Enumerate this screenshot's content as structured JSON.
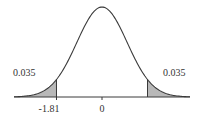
{
  "chart_data": {
    "type": "area",
    "title": "",
    "xlabel": "",
    "ylabel": "",
    "distribution": "bell curve",
    "mean": 0,
    "tick_labels": [
      "-1.81",
      "0"
    ],
    "shaded_regions": [
      {
        "side": "left",
        "bound": -1.81,
        "area_label": "0.035"
      },
      {
        "side": "right",
        "bound": 1.81,
        "area_label": "0.035"
      }
    ],
    "annotations": [
      "0.035",
      "0.035"
    ],
    "xlim": [
      -3.5,
      3.5
    ],
    "grid": false,
    "legend": "none"
  },
  "labels": {
    "left_area": "0.035",
    "right_area": "0.035",
    "left_bound": "-1.81",
    "center": "0"
  },
  "colors": {
    "curve": "#3a3a3a",
    "shade": "#b8b8b8",
    "axis": "#3a3a3a",
    "text": "#333333"
  }
}
